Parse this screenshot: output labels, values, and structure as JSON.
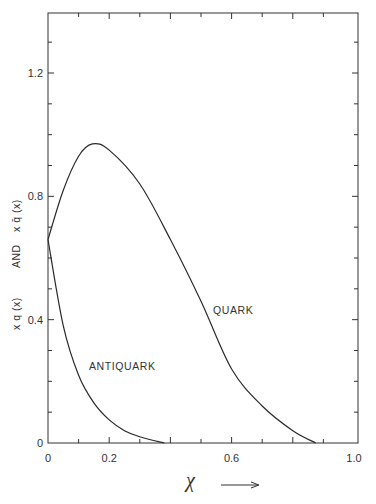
{
  "chart_data": {
    "type": "line",
    "title": "",
    "xlabel": "x →",
    "ylabel": "x q(x)   AND   x q̄(x)",
    "xlim": [
      0,
      1.0
    ],
    "ylim": [
      0,
      1.4
    ],
    "x_ticks": [
      0,
      0.2,
      0.6,
      1.0
    ],
    "x_tick_labels": [
      "0",
      "0.2",
      "0.6",
      "1.0"
    ],
    "y_ticks": [
      0,
      0.4,
      0.8,
      1.2
    ],
    "y_tick_labels": [
      "0",
      "0.4",
      "0.8",
      "1.2"
    ],
    "minor_x_step": 0.1,
    "minor_y_step": 0.1,
    "grid": false,
    "legend": "inline labels",
    "series": [
      {
        "name": "QUARK",
        "x": [
          0,
          0.05,
          0.1,
          0.145,
          0.2,
          0.3,
          0.4,
          0.5,
          0.6,
          0.7,
          0.8,
          0.875
        ],
        "values": [
          0.66,
          0.82,
          0.93,
          0.97,
          0.95,
          0.84,
          0.66,
          0.46,
          0.24,
          0.12,
          0.04,
          0.0
        ]
      },
      {
        "name": "ANTIQUARK",
        "x": [
          0,
          0.05,
          0.1,
          0.15,
          0.2,
          0.25,
          0.3,
          0.38
        ],
        "values": [
          0.66,
          0.38,
          0.22,
          0.13,
          0.075,
          0.04,
          0.02,
          0.0
        ]
      }
    ],
    "annotations": [
      {
        "text": "QUARK",
        "x": 0.52,
        "y": 0.4
      },
      {
        "text": "ANTIQUARK",
        "x": 0.11,
        "y": 0.2
      }
    ]
  },
  "labels": {
    "quark": "QUARK",
    "antiquark": "ANTIQUARK",
    "x_axis_symbol": "χ",
    "y_part1": "x q (x)",
    "y_and": "AND",
    "y_part2": "x q̄ (x)"
  }
}
